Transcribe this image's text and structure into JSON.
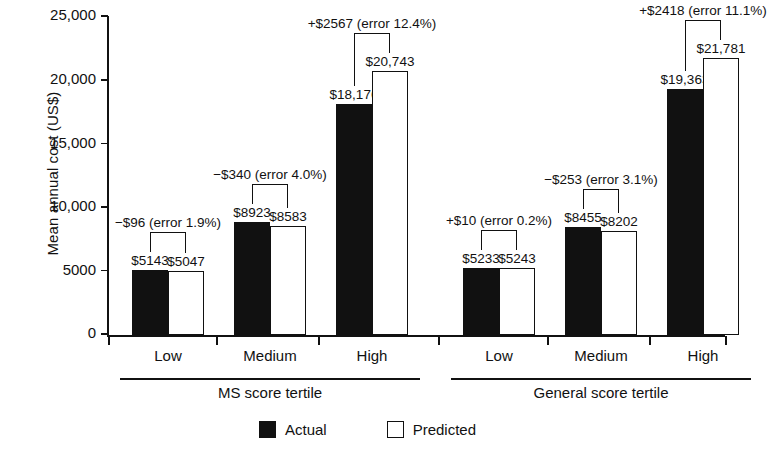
{
  "chart_data": {
    "type": "bar",
    "title": "",
    "xlabel": "",
    "ylabel": "Mean annual cost (US$)",
    "ylim": [
      0,
      25000
    ],
    "yticks": [
      0,
      5000,
      10000,
      15000,
      20000,
      25000
    ],
    "ytick_labels": [
      "0",
      "5000",
      "10,000",
      "15,000",
      "20,000",
      "25,000"
    ],
    "grid": false,
    "legend_position": "bottom-center",
    "categories": [
      "Low",
      "Medium",
      "High",
      "Low",
      "Medium",
      "High"
    ],
    "group_titles": [
      "MS score tertile",
      "General score tertile"
    ],
    "series": [
      {
        "name": "Actual",
        "color": "#111111",
        "values": [
          5143,
          8923,
          18176,
          5233,
          8455,
          19363
        ],
        "labels": [
          "$5143",
          "$8923",
          "$18,176",
          "$5233",
          "$8455",
          "$19,363"
        ]
      },
      {
        "name": "Predicted",
        "color": "#ffffff",
        "values": [
          5047,
          8583,
          20743,
          5243,
          8202,
          21781
        ],
        "labels": [
          "$5047",
          "$8583",
          "$20,743",
          "$5243",
          "$8202",
          "$21,781"
        ]
      }
    ],
    "annotations": [
      "−$96 (error 1.9%)",
      "−$340 (error 4.0%)",
      "+$2567 (error 12.4%)",
      "+$10 (error 0.2%)",
      "−$253 (error 3.1%)",
      "+$2418 (error 11.1%)"
    ]
  },
  "legend": {
    "items": [
      {
        "label": "Actual",
        "swatch": "filled-square-icon"
      },
      {
        "label": "Predicted",
        "swatch": "hollow-square-icon"
      }
    ]
  }
}
